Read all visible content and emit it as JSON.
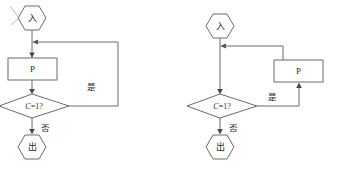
{
  "page": {
    "background_color": "#ffffff",
    "line_color": "#6b6b6b",
    "text_color": "#2b2b2b",
    "width": 339,
    "height": 174
  },
  "diagrams": [
    {
      "id": "left-flowchart",
      "name": "while-loop-flowchart",
      "nodes": {
        "entry": {
          "label": "入",
          "shape": "hexagon"
        },
        "process": {
          "label": "P",
          "shape": "rectangle"
        },
        "decision": {
          "label": "C=1?",
          "var": "C",
          "rest": "=1?",
          "shape": "diamond"
        },
        "exit": {
          "label": "出",
          "shape": "hexagon"
        }
      },
      "edge_labels": {
        "yes": "是",
        "no": "否"
      }
    },
    {
      "id": "right-flowchart",
      "name": "do-while-loop-flowchart",
      "nodes": {
        "entry": {
          "label": "入",
          "shape": "hexagon"
        },
        "process": {
          "label": "P",
          "shape": "rectangle"
        },
        "decision": {
          "label": "C=1?",
          "var": "C",
          "rest": "=1?",
          "shape": "diamond"
        },
        "exit": {
          "label": "出",
          "shape": "hexagon"
        }
      },
      "edge_labels": {
        "yes": "是",
        "no": "否"
      }
    }
  ]
}
